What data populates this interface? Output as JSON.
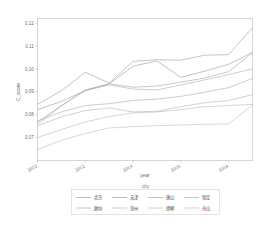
{
  "chart_data": {
    "type": "line",
    "title": "",
    "xlabel": "year",
    "ylabel": "C_score",
    "xlim": [
      2010,
      2019
    ],
    "ylim": [
      0.06,
      0.122
    ],
    "grid": false,
    "legend_position": "bottom",
    "legend_title": "city",
    "x": [
      2010,
      2011,
      2012,
      2013,
      2014,
      2015,
      2016,
      2017,
      2018,
      2019
    ],
    "xticks": [
      "2010",
      "2012",
      "2014",
      "2016",
      "2018"
    ],
    "xtick_values": [
      2010,
      2012,
      2014,
      2016,
      2018
    ],
    "yticks": [
      "0.07",
      "0.08",
      "0.09",
      "0.10",
      "0.11",
      "0.12"
    ],
    "ytick_values": [
      0.07,
      0.08,
      0.09,
      0.1,
      0.11,
      0.12
    ],
    "series": [
      {
        "name": "北京",
        "color": "#9aa3ad",
        "values": [
          0.0845,
          0.0905,
          0.0985,
          0.0938,
          0.1033,
          0.104,
          0.1038,
          0.106,
          0.1062,
          0.118
        ]
      },
      {
        "name": "天津",
        "color": "#9c9c9c",
        "values": [
          0.0822,
          0.0858,
          0.0905,
          0.0935,
          0.1012,
          0.1035,
          0.0963,
          0.099,
          0.102,
          0.1072
        ]
      },
      {
        "name": "唐山",
        "color": "#a5a5a5",
        "values": [
          0.0768,
          0.084,
          0.0908,
          0.0935,
          0.092,
          0.0925,
          0.0942,
          0.096,
          0.0988,
          0.107
        ]
      },
      {
        "name": "保定",
        "color": "#adadad",
        "values": [
          0.0758,
          0.0838,
          0.0905,
          0.093,
          0.0912,
          0.0908,
          0.093,
          0.0952,
          0.0975,
          0.1
        ]
      },
      {
        "name": "廊坊",
        "color": "#b0b0b0",
        "values": [
          0.0772,
          0.0812,
          0.084,
          0.0848,
          0.0862,
          0.0868,
          0.088,
          0.0898,
          0.0918,
          0.0958
        ]
      },
      {
        "name": "沧州",
        "color": "#b5b5b5",
        "values": [
          0.0752,
          0.079,
          0.0818,
          0.083,
          0.0812,
          0.0815,
          0.0835,
          0.0852,
          0.0862,
          0.0888
        ]
      },
      {
        "name": "邯郸",
        "color": "#bababa",
        "values": [
          0.07,
          0.0735,
          0.0768,
          0.0792,
          0.0808,
          0.0812,
          0.0822,
          0.0835,
          0.084,
          0.0845
        ]
      },
      {
        "name": "舟山",
        "color": "#bfbfbf",
        "values": [
          0.0648,
          0.0688,
          0.0718,
          0.0742,
          0.0748,
          0.0752,
          0.0755,
          0.0758,
          0.076,
          0.0842
        ]
      }
    ]
  },
  "legend": {
    "title": "city",
    "row1": [
      "北京",
      "天津",
      "唐山",
      "保定"
    ],
    "row2": [
      "廊坊",
      "沧州",
      "邯郸",
      "舟山"
    ]
  },
  "axes": {
    "xlabel": "year",
    "ylabel": "C_score",
    "xticks": [
      "2010",
      "2012",
      "2014",
      "2016",
      "2018"
    ],
    "yticks": [
      "0.07",
      "0.08",
      "0.09",
      "0.10",
      "0.11",
      "0.12"
    ]
  }
}
